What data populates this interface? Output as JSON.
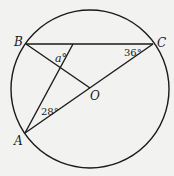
{
  "diagram": {
    "points": {
      "A": "A",
      "B": "B",
      "C": "C",
      "O": "O"
    },
    "angles": {
      "a": "a°",
      "angle_A": "28°",
      "angle_C": "36°"
    },
    "colors": {
      "stroke": "#1a1a1a",
      "background": "#f2f2f0"
    }
  }
}
